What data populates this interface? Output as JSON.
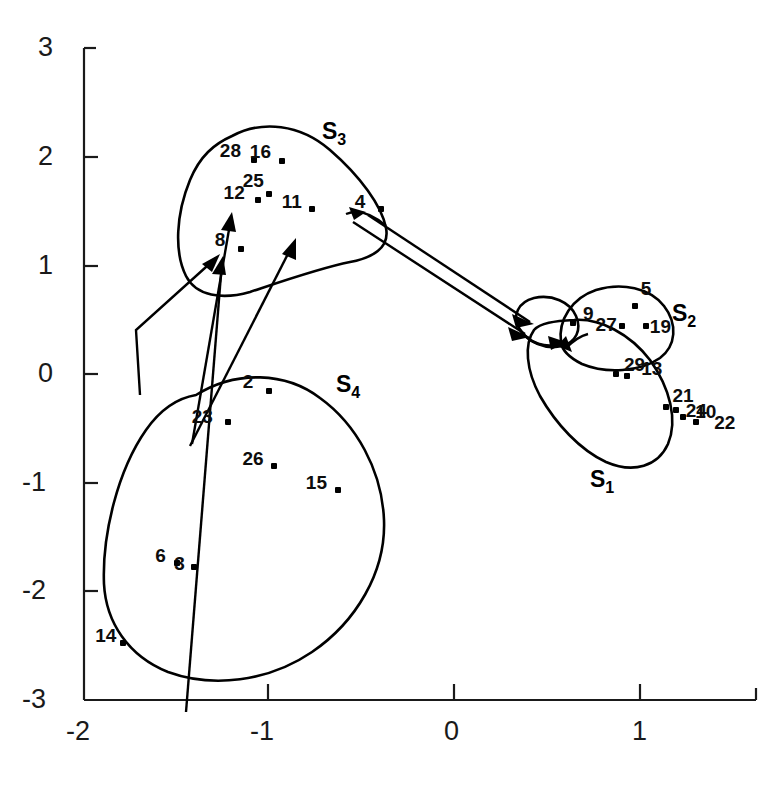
{
  "chart_data": {
    "type": "scatter",
    "title": "",
    "xlabel": "",
    "ylabel": "",
    "xlim": [
      -2.15,
      1.45
    ],
    "ylim": [
      -3.0,
      3.0
    ],
    "xticks": [
      -2,
      -1,
      0,
      1
    ],
    "yticks": [
      3,
      2,
      1,
      0,
      -1,
      -2,
      -3
    ],
    "xtick_labels": [
      "-2",
      "-1",
      "0",
      "1"
    ],
    "ytick_labels": [
      "3",
      "2",
      "1",
      "0",
      "-1",
      "-2",
      "-3"
    ],
    "grid": false,
    "legend": "none",
    "cluster_labels": [
      {
        "name": "S",
        "subscript": "3",
        "x": -0.72,
        "y": 2.38
      },
      {
        "name": "S",
        "subscript": "2",
        "x": 1.06,
        "y": 0.6
      },
      {
        "name": "S",
        "subscript": "4",
        "x": -0.58,
        "y": -0.03
      },
      {
        "name": "S",
        "subscript": "1",
        "x": 0.82,
        "y": -1.12
      }
    ],
    "points": [
      {
        "id": "28",
        "x": -1.24,
        "y": 1.97,
        "cluster": "S3"
      },
      {
        "id": "16",
        "x": -1.09,
        "y": 1.96,
        "cluster": "S3"
      },
      {
        "id": "25",
        "x": -1.16,
        "y": 1.66,
        "cluster": "S3"
      },
      {
        "id": "12",
        "x": -1.22,
        "y": 1.6,
        "cluster": "S3"
      },
      {
        "id": "11",
        "x": -0.93,
        "y": 1.52,
        "cluster": "S3"
      },
      {
        "id": "4",
        "x": -0.56,
        "y": 1.52,
        "cluster": "S3"
      },
      {
        "id": "8",
        "x": -1.31,
        "y": 1.15,
        "cluster": "S3"
      },
      {
        "id": "9",
        "x": 0.47,
        "y": 0.47,
        "cluster": "S2"
      },
      {
        "id": "5",
        "x": 0.8,
        "y": 0.63,
        "cluster": "S2"
      },
      {
        "id": "27",
        "x": 0.73,
        "y": 0.44,
        "cluster": "S2"
      },
      {
        "id": "19",
        "x": 0.86,
        "y": 0.44,
        "cluster": "S2"
      },
      {
        "id": "29",
        "x": 0.7,
        "y": 0.0,
        "cluster": "S1"
      },
      {
        "id": "13",
        "x": 0.76,
        "y": -0.02,
        "cluster": "S1"
      },
      {
        "id": "21",
        "x": 0.97,
        "y": -0.3,
        "cluster": "S1"
      },
      {
        "id": "24",
        "x": 1.02,
        "y": -0.33,
        "cluster": "S1"
      },
      {
        "id": "10",
        "x": 1.06,
        "y": -0.4,
        "cluster": "S1"
      },
      {
        "id": "22",
        "x": 1.13,
        "y": -0.44,
        "cluster": "S1"
      },
      {
        "id": "2",
        "x": -1.16,
        "y": -0.16,
        "cluster": "S4"
      },
      {
        "id": "23",
        "x": -1.38,
        "y": -0.44,
        "cluster": "S4"
      },
      {
        "id": "26",
        "x": -1.13,
        "y": -0.85,
        "cluster": "S4"
      },
      {
        "id": "15",
        "x": -0.79,
        "y": -1.07,
        "cluster": "S4"
      },
      {
        "id": "6",
        "x": -1.65,
        "y": -1.74,
        "cluster": "S4"
      },
      {
        "id": "3",
        "x": -1.56,
        "y": -1.78,
        "cluster": "S4"
      },
      {
        "id": "14",
        "x": -1.94,
        "y": -2.48,
        "cluster": "S4"
      }
    ],
    "arrows": [
      {
        "from": "S4-region",
        "to": "8",
        "note": "arrow into point 8"
      },
      {
        "from": "S4-region",
        "to": "8",
        "note": "second arrow into point 8"
      },
      {
        "from": "23-region",
        "to": "25",
        "note": "arrow into point 25"
      },
      {
        "from": "23-region",
        "to": "11",
        "note": "arrow into point 11"
      },
      {
        "from": "4",
        "to": "S2-cluster",
        "note": "arrow from point 4 to cluster S2"
      },
      {
        "from": "11",
        "to": "S2-cluster",
        "note": "arrow from point 11 to cluster S2"
      }
    ],
    "contours": [
      {
        "cluster": "S3",
        "description": "closed hand-drawn outline around points 28,16,25,12,11,4,8"
      },
      {
        "cluster": "S2",
        "description": "small closed outline around points 5,27,19 with lobe around 9"
      },
      {
        "cluster": "S1",
        "description": "elongated outline around points 29,13,21,24,10,22"
      },
      {
        "cluster": "S4",
        "description": "large closed outline around points 2,23,26,15,6,3,14"
      }
    ]
  },
  "figure": {
    "axis_color": "#1a1a1a",
    "point_color": "#000000",
    "contour_color": "#000000",
    "background": "#ffffff"
  }
}
